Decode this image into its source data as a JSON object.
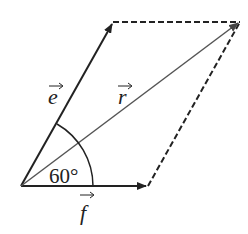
{
  "diagram": {
    "type": "vector-parallelogram",
    "vectors": [
      {
        "name": "e",
        "label": "e",
        "from": [
          21,
          186
        ],
        "to": [
          113,
          22
        ],
        "style": "solid"
      },
      {
        "name": "f",
        "label": "f",
        "from": [
          21,
          186
        ],
        "to": [
          148,
          186
        ],
        "style": "solid"
      },
      {
        "name": "r",
        "label": "r",
        "from": [
          21,
          186
        ],
        "to": [
          240,
          22
        ],
        "style": "solid-gray"
      }
    ],
    "dashed_edges": [
      {
        "from": [
          113,
          22
        ],
        "to": [
          240,
          22
        ]
      },
      {
        "from": [
          148,
          186
        ],
        "to": [
          240,
          22
        ]
      }
    ],
    "angle": {
      "label": "60°",
      "between": [
        "e",
        "f"
      ],
      "value_deg": 60
    },
    "colors": {
      "stroke": "#222222",
      "resultant": "#555555"
    }
  },
  "labels": {
    "e": "e",
    "f": "f",
    "r": "r",
    "angle": "60°",
    "arrow_accent": "→"
  }
}
